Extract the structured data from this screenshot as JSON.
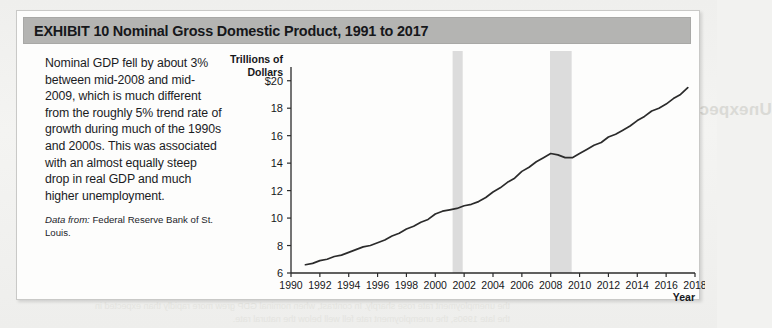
{
  "exhibit": {
    "title": "EXHIBIT 10  Nominal Gross Domestic Product, 1991 to 2017",
    "header_color": "#b4b4b2"
  },
  "caption": {
    "body": "Nominal GDP fell by about 3% between mid-2008 and mid-2009, which is much different from the roughly 5% trend rate of growth during much of the 1990s and 2000s. This was associated with an almost equally steep drop in real GDP and much higher unemployment.",
    "source_label": "Data from:",
    "source_text": " Federal Reserve Bank of St. Louis."
  },
  "bleed": {
    "heading": "Unexpected Nominal GDP and Unemployment",
    "paragraph": "and unemployment are related to aggregate demand in the short run,\nand variations in the growth rate of nominal GDP have an unexpected\neffect on the real economy. When nominal GDP grows more slowly\nthan expected, firms find that sales are lower than anticipated, and\nthey cut back on production, laying off workers. The unemployment\nrate rises above the natural rate. When nominal GDP grows faster\nthan expected, the unemployment rate falls below the natural rate.",
    "bottom": "the unemployment rate rose sharply. In contrast, when nominal GDP grew more rapidly than expected in\nthe late 1990s, the unemployment rate fell well below the natural rate."
  },
  "chart_data": {
    "type": "line",
    "title": "Nominal Gross Domestic Product, 1991 to 2017",
    "xlabel": "Year",
    "ylabel": "Trillions of Dollars",
    "ylabel_lines": [
      "Trillions of",
      "Dollars"
    ],
    "xlim": [
      1990,
      2018
    ],
    "ylim": [
      6,
      21
    ],
    "grid": false,
    "legend": "none",
    "line_color": "#2b2b2b",
    "recession_band_color": "#dcdcdc",
    "yticks": [
      6,
      8,
      10,
      12,
      14,
      16,
      18,
      20
    ],
    "ytick_labels": [
      "6",
      "8",
      "10",
      "12",
      "14",
      "16",
      "18",
      "$20"
    ],
    "xticks": [
      1990,
      1992,
      1994,
      1996,
      1998,
      2000,
      2002,
      2004,
      2006,
      2008,
      2010,
      2012,
      2014,
      2016,
      2018
    ],
    "xtick_labels": [
      "1990",
      "1992",
      "1994",
      "1996",
      "1998",
      "2000",
      "2002",
      "2004",
      "2006",
      "2008",
      "2010",
      "2012",
      "2014",
      "2016",
      "2018"
    ],
    "recession_bands": [
      {
        "start": 2001.2,
        "end": 2001.9
      },
      {
        "start": 2007.95,
        "end": 2009.45
      }
    ],
    "series": [
      {
        "name": "Nominal GDP",
        "x": [
          1991.0,
          1991.5,
          1992.0,
          1992.5,
          1993.0,
          1993.5,
          1994.0,
          1994.5,
          1995.0,
          1995.5,
          1996.0,
          1996.5,
          1997.0,
          1997.5,
          1998.0,
          1998.5,
          1999.0,
          1999.5,
          2000.0,
          2000.5,
          2001.0,
          2001.5,
          2002.0,
          2002.5,
          2003.0,
          2003.5,
          2004.0,
          2004.5,
          2005.0,
          2005.5,
          2006.0,
          2006.5,
          2007.0,
          2007.5,
          2008.0,
          2008.5,
          2009.0,
          2009.5,
          2010.0,
          2010.5,
          2011.0,
          2011.5,
          2012.0,
          2012.5,
          2013.0,
          2013.5,
          2014.0,
          2014.5,
          2015.0,
          2015.5,
          2016.0,
          2016.5,
          2017.0,
          2017.5
        ],
        "y": [
          6.6,
          6.7,
          6.9,
          7.0,
          7.2,
          7.3,
          7.5,
          7.7,
          7.9,
          8.0,
          8.2,
          8.4,
          8.7,
          8.9,
          9.2,
          9.4,
          9.7,
          9.9,
          10.3,
          10.5,
          10.6,
          10.7,
          10.9,
          11.0,
          11.2,
          11.5,
          11.9,
          12.2,
          12.6,
          12.9,
          13.4,
          13.7,
          14.1,
          14.4,
          14.7,
          14.6,
          14.4,
          14.4,
          14.7,
          15.0,
          15.3,
          15.5,
          15.9,
          16.1,
          16.4,
          16.7,
          17.1,
          17.4,
          17.8,
          18.0,
          18.3,
          18.7,
          19.0,
          19.5
        ]
      }
    ]
  }
}
